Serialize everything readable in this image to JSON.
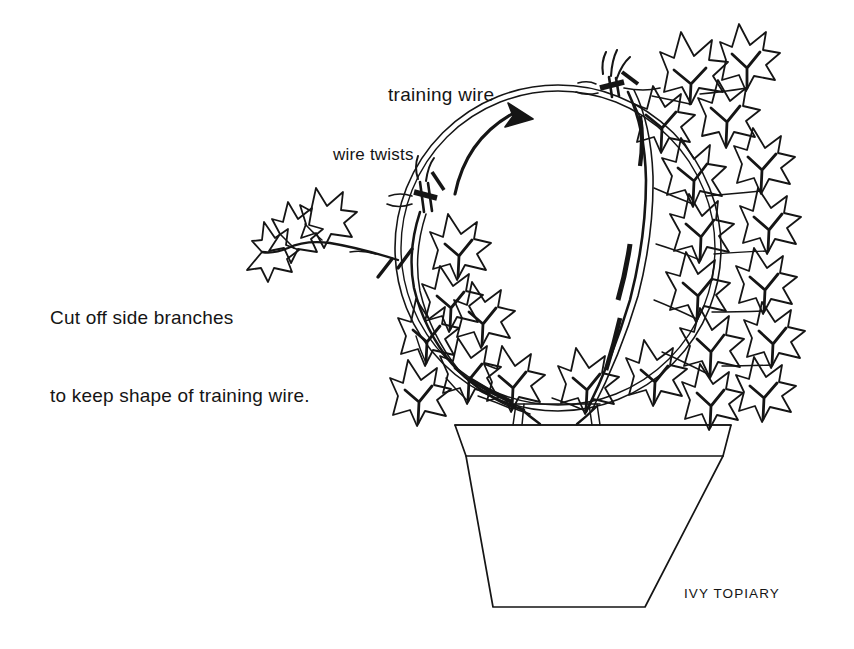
{
  "figure": {
    "title": "IVY TOPIARY",
    "background_color": "#ffffff",
    "ink_color": "#151515"
  },
  "labels": {
    "training_wire": "training wire",
    "wire_twists": "wire twists",
    "instruction_line_1": "Cut off side branches",
    "instruction_line_2": "to keep shape of training wire.",
    "caption": "IVY TOPIARY"
  },
  "annotations": {
    "direction_arrow": "curved-arrow pointing clockwise along the upper-left arc of the hoop toward the top wire twist",
    "cut_marks": "two short slash strokes marking where side branches were pruned"
  },
  "parts": {
    "hoop": "circular double-line training wire hoop",
    "twist_top": "wire twist at the top of the hoop with splayed wire tails",
    "twist_left": "wire twist on the upper-left of the hoop with splayed wire tails",
    "pot": "tapered terracotta pot with a rim band",
    "soil_line": "soil surface line across the top of the pot",
    "stems": "ivy stems rising from the soil and trained around the hoop",
    "cut_branch": "detached side branch with three ivy leaves at the left"
  }
}
